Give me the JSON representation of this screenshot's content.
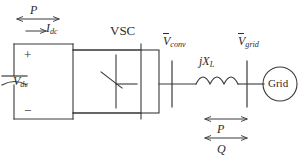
{
  "figure": {
    "background_color": "#ffffff",
    "line_color": "#3a3a3a",
    "text_color": "#2b2b2b"
  },
  "labels": {
    "power_dc": "P",
    "current_dc_symbol": "I",
    "current_dc_sub": "dc",
    "converter": "VSC",
    "voltage_dc_symbol": "V",
    "voltage_dc_sub": "dc",
    "polarity_plus": "+",
    "polarity_minus": "−",
    "voltage_conv_symbol": "V",
    "voltage_conv_sub": "conv",
    "reactance_symbol": "jX",
    "reactance_sub": "L",
    "voltage_grid_symbol": "V",
    "voltage_grid_sub": "grid",
    "grid_source": "Grid",
    "power_active": "P",
    "power_reactive": "Q"
  },
  "arrows": {
    "dc_power_arrow": "double-headed",
    "dc_current_arrow": "single-headed-right",
    "ac_active_power_arrow": "double-headed",
    "ac_reactive_power_arrow": "double-headed"
  },
  "components": {
    "dc_capacitor": "capacitor-curved-plate",
    "converter_block": "vsc-switch-block",
    "switch_symbol": "igbt-switch",
    "inductor": "coil-three-arcs",
    "bus_conv": "vertical-busbar",
    "bus_grid": "vertical-busbar",
    "grid_circle": "ac-source-circle"
  }
}
